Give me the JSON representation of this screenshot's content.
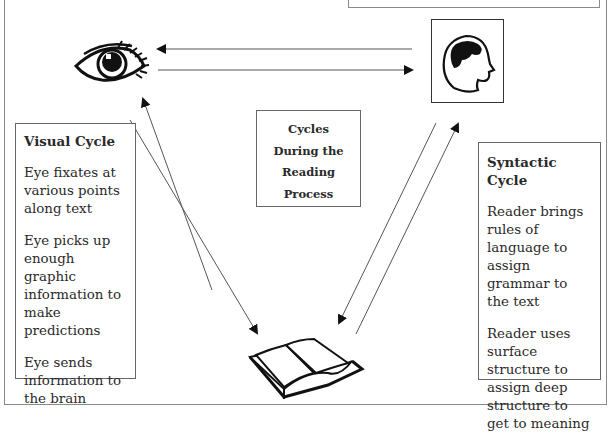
{
  "diagram": {
    "title": "Cycles During the Reading Process",
    "center_label_lines": [
      "Cycles",
      "During the",
      "Reading",
      "Process"
    ],
    "nodes": [
      {
        "id": "eye",
        "icon": "eye-icon"
      },
      {
        "id": "brain",
        "icon": "head-brain-icon"
      },
      {
        "id": "book",
        "icon": "open-book-icon"
      }
    ],
    "edges": [
      {
        "from": "brain",
        "to": "eye"
      },
      {
        "from": "eye",
        "to": "brain"
      },
      {
        "from": "book",
        "to": "eye"
      },
      {
        "from": "eye",
        "to": "book"
      },
      {
        "from": "book",
        "to": "brain"
      },
      {
        "from": "brain",
        "to": "book"
      }
    ]
  },
  "visual_cycle": {
    "title": "Visual Cycle",
    "points": [
      "Eye fixates at various points along text",
      "Eye picks up enough graphic information to make predictions",
      "Eye sends information to the brain"
    ]
  },
  "syntactic_cycle": {
    "title": "Syntactic Cycle",
    "points": [
      "Reader brings rules of language to assign grammar to the text",
      "Reader uses surface structure to assign deep structure to get to meaning"
    ]
  },
  "colors": {
    "ink": "#111111",
    "frame": "#8a8a8a",
    "text": "#2a2a2a"
  }
}
